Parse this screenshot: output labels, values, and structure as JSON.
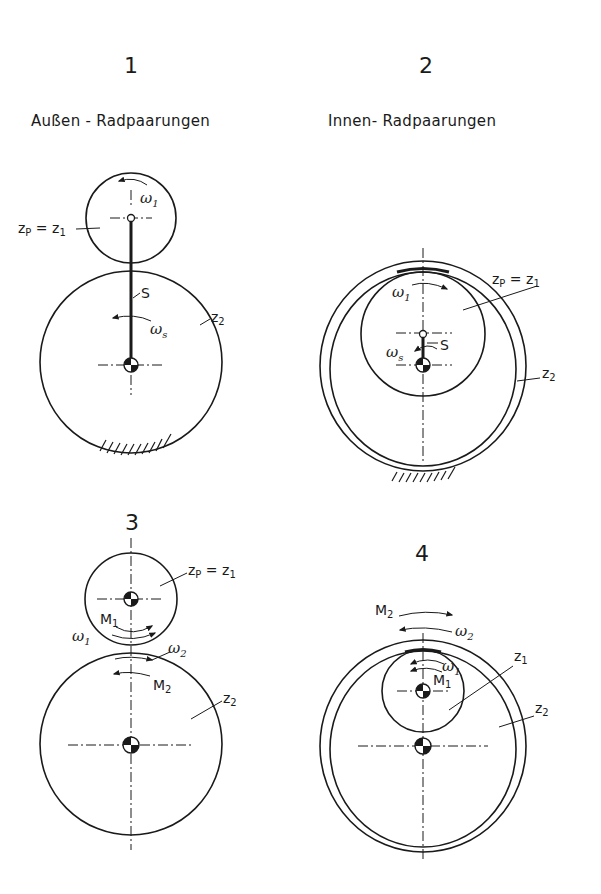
{
  "figure": {
    "panels": [
      {
        "number": "1",
        "heading": "Außen - Radpaarungen",
        "labels": {
          "planet": "z",
          "planet_sub": "P",
          "planet_eq": " = z",
          "planet_eq_sub": "1",
          "sun": "z",
          "sun_sub": "2",
          "carrier": "S",
          "omega1": "ω",
          "omega1_sub": "1",
          "omegas": "ω",
          "omegas_sub": "s"
        }
      },
      {
        "number": "2",
        "heading": "Innen- Radpaarungen",
        "labels": {
          "planet": "z",
          "planet_sub": "P",
          "planet_eq": " = z",
          "planet_eq_sub": "1",
          "ring": "z",
          "ring_sub": "2",
          "carrier": "S",
          "omega1": "ω",
          "omega1_sub": "1",
          "omegas": "ω",
          "omegas_sub": "s"
        }
      },
      {
        "number": "3",
        "labels": {
          "planet": "z",
          "planet_sub": "P",
          "planet_eq": " = z",
          "planet_eq_sub": "1",
          "sun": "z",
          "sun_sub": "2",
          "m1": "M",
          "m1_sub": "1",
          "m2": "M",
          "m2_sub": "2",
          "omega1": "ω",
          "omega1_sub": "1",
          "omega2": "ω",
          "omega2_sub": "2"
        }
      },
      {
        "number": "4",
        "labels": {
          "pinion": "z",
          "pinion_sub": "1",
          "ring": "z",
          "ring_sub": "2",
          "m1": "M",
          "m1_sub": "1",
          "m2": "M",
          "m2_sub": "2",
          "omega1": "ω",
          "omega1_sub": "1",
          "omega2": "ω",
          "omega2_sub": "2"
        }
      }
    ]
  }
}
